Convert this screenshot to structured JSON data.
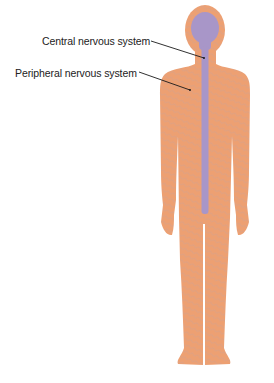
{
  "diagram": {
    "type": "anatomical-illustration",
    "labels": [
      {
        "id": "cns",
        "text": "Central nervous system",
        "pointer_target": "spinal-cord"
      },
      {
        "id": "pns",
        "text": "Peripheral nervous system",
        "pointer_target": "body-nerves"
      }
    ],
    "colors": {
      "body": "#EDA072",
      "body_texture": "#C8A090",
      "central_nervous_system": "#A896C8",
      "leader_line": "#1a1a1a",
      "text": "#222222"
    }
  }
}
